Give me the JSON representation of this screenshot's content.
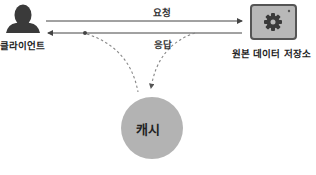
{
  "nodes": {
    "client": {
      "label": "클라이언트",
      "icon": "person-icon"
    },
    "origin": {
      "label": "원본 데이터 저장소",
      "icon": "gear-icon"
    },
    "cache": {
      "label": "캐시"
    }
  },
  "edges": {
    "request": {
      "label": "요청",
      "from": "client",
      "to": "origin",
      "style": "solid"
    },
    "response": {
      "label": "응답",
      "from": "origin",
      "to": "client",
      "style": "solid"
    },
    "to_cache": {
      "from": "origin-response",
      "to": "cache",
      "style": "dashed"
    },
    "from_cache": {
      "from": "cache",
      "to": "client-response",
      "style": "dashed"
    }
  },
  "colors": {
    "icon_dark": "#3a3a3a",
    "box_fill": "#b8b8b8",
    "box_border": "#555555",
    "cache_fill": "#b3b3b3",
    "line": "#444444",
    "dash": "#888888"
  }
}
